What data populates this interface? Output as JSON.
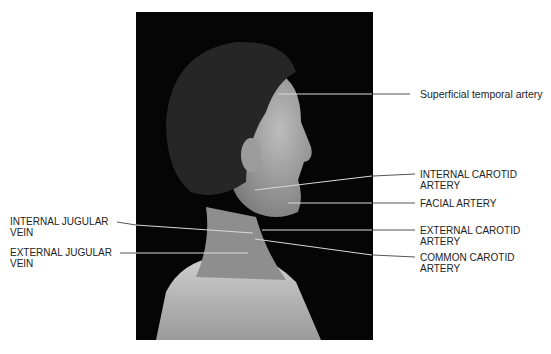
{
  "figure": {
    "labels": {
      "superficial_temporal_artery": "Superficial temporal artery",
      "internal_carotid_artery": "INTERNAL CAROTID\nARTERY",
      "facial_artery": "FACIAL ARTERY",
      "external_carotid_artery": "EXTERNAL CAROTID\nARTERY",
      "common_carotid_artery": "COMMON CAROTID\nARTERY",
      "internal_jugular_vein": "INTERNAL JUGULAR\nVEIN",
      "external_jugular_vein": "EXTERNAL JUGULAR\nVEIN"
    }
  }
}
